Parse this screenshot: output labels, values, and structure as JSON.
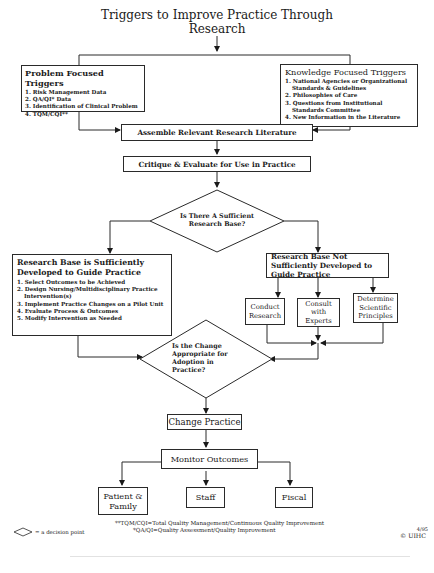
{
  "title": {
    "line1": "Triggers to Improve Practice Through",
    "line2": "Research"
  },
  "problem_triggers": {
    "header": "Problem Focused Triggers",
    "items": [
      "1. Risk Management Data",
      "2. QA/QI* Data",
      "3. Identification of Clinical Problem",
      "4. TQM/CQI**"
    ]
  },
  "knowledge_triggers": {
    "header": "Knowledge Focused Triggers",
    "items": [
      "1. National Agencies or Organizational Standards & Guidelines",
      "2. Philosophies of Care",
      "3. Questions from Institutional Standards Committee",
      "4. New Information in the Literature"
    ]
  },
  "assemble": "Assemble Relevant Research Literature",
  "critique": "Critique & Evaluate for Use in Practice",
  "decision1": {
    "line1": "Is There A Sufficient",
    "line2": "Research Base?"
  },
  "sufficient": {
    "header": "Research Base is Sufficiently Developed to Guide Practice",
    "items": [
      "1. Select Outcomes to be Achieved",
      "2. Design Nursing/Multidisciplinary Practice Intervention(s)",
      "3. Implement Practice Changes on a Pilot Unit",
      "4. Evaluate Process & Outcomes",
      "5. Modify Intervention as Needed"
    ]
  },
  "not_sufficient": {
    "header": "Research Base Not Sufficiently Developed to Guide Practice"
  },
  "actions": {
    "conduct": "Conduct Research",
    "consult": "Consult with Experts",
    "determine": "Determine Scientific Principles"
  },
  "decision2": {
    "line1": "Is the Change",
    "line2": "Appropriate for",
    "line3": "Adoption in",
    "line4": "Practice?"
  },
  "change_practice": "Change Practice",
  "monitor": "Monitor Outcomes",
  "outcomes": {
    "patient": "Patient & Family",
    "staff": "Staff",
    "fiscal": "Fiscal"
  },
  "footnotes": {
    "tqm": "**TQM/CQI=Total Quality Management/Continuous Quality Improvement",
    "qa": "*QA/QI=Quality Assessment/Quality Improvement"
  },
  "legend": "= a decision point",
  "copyright": {
    "date": "4/95",
    "mark": "© UIHC"
  }
}
